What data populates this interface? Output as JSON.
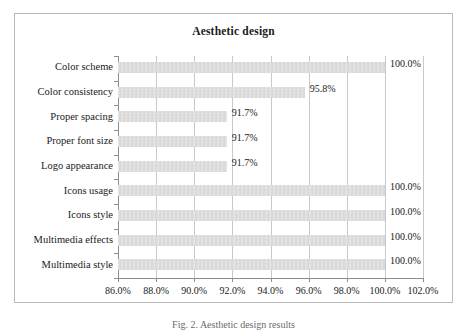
{
  "figure": {
    "caption": "Fig. 2. Aesthetic design results"
  },
  "chart_data": {
    "type": "bar",
    "orientation": "horizontal",
    "title": "Aesthetic design",
    "xlabel": "",
    "ylabel": "",
    "categories": [
      "Color scheme",
      "Color consistency",
      "Proper spacing",
      "Proper font size",
      "Logo appearance",
      "Icons usage",
      "Icons style",
      "Multimedia effects",
      "Multimedia style"
    ],
    "values": [
      100.0,
      95.8,
      91.7,
      91.7,
      91.7,
      100.0,
      100.0,
      100.0,
      100.0
    ],
    "value_labels": [
      "100.0%",
      "95.8%",
      "91.7%",
      "91.7%",
      "91.7%",
      "100.0%",
      "100.0%",
      "100.0%",
      "100.0%"
    ],
    "xlim": [
      86.0,
      102.0
    ],
    "xticks": [
      86.0,
      88.0,
      90.0,
      92.0,
      94.0,
      96.0,
      98.0,
      100.0,
      102.0
    ],
    "xtick_labels": [
      "86.0%",
      "88.0%",
      "90.0%",
      "92.0%",
      "94.0%",
      "96.0%",
      "98.0%",
      "100.0%",
      "102.0%"
    ],
    "grid": "vertical",
    "legend": "none",
    "bar_color": "#d9d9d9",
    "frame_color": "#b9b9b9",
    "gridline_color": "#c9c9c9",
    "axis_color": "#8d8d8d",
    "text_color": "#1a1a1a"
  }
}
